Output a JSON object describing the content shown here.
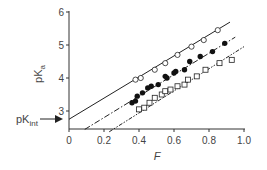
{
  "chart_data": {
    "type": "scatter",
    "title": "",
    "xlabel": "F",
    "ylabel": "pKa",
    "xlim": [
      0,
      1.0
    ],
    "ylim": [
      2.5,
      6
    ],
    "x_ticks": [
      "0",
      "0.2",
      "0.4",
      "0.6",
      "0.8",
      "1.0"
    ],
    "y_ticks": [
      "3",
      "4",
      "5",
      "6"
    ],
    "grid": false,
    "annotations": [
      {
        "text": "pKint",
        "points_to_y": 2.75,
        "style": "arrow"
      }
    ],
    "series": [
      {
        "name": "open circles",
        "marker": "open-circle",
        "line": "solid",
        "x": [
          0.38,
          0.41,
          0.49,
          0.55,
          0.62,
          0.7,
          0.77,
          0.85
        ],
        "y": [
          3.95,
          4.0,
          4.25,
          4.45,
          4.7,
          4.95,
          5.15,
          5.45
        ],
        "fit": {
          "intercept": 2.75,
          "slope": 3.2,
          "x_range": [
            0,
            0.92
          ]
        }
      },
      {
        "name": "filled circles",
        "marker": "filled-circle",
        "line": "dash-dot",
        "x": [
          0.36,
          0.38,
          0.39,
          0.42,
          0.45,
          0.47,
          0.51,
          0.55,
          0.56,
          0.6,
          0.61,
          0.66,
          0.69,
          0.75,
          0.82,
          0.89
        ],
        "y": [
          3.25,
          3.3,
          3.45,
          3.55,
          3.7,
          3.75,
          3.8,
          4.05,
          4.0,
          4.15,
          4.2,
          4.25,
          4.5,
          4.65,
          4.8,
          5.05
        ],
        "fit": {
          "intercept": 2.15,
          "slope": 3.25,
          "x_range": [
            0.09,
            0.95
          ]
        }
      },
      {
        "name": "open squares",
        "marker": "open-square",
        "line": "dash-dot-dot",
        "x": [
          0.4,
          0.43,
          0.46,
          0.49,
          0.53,
          0.55,
          0.58,
          0.62,
          0.66,
          0.68,
          0.73,
          0.78,
          0.86,
          0.93
        ],
        "y": [
          3.05,
          3.1,
          3.25,
          3.4,
          3.5,
          3.6,
          3.65,
          3.75,
          3.8,
          3.95,
          4.05,
          4.25,
          4.45,
          4.55
        ],
        "fit": {
          "intercept": 1.6,
          "slope": 3.35,
          "x_range": [
            0.23,
            1.0
          ]
        }
      }
    ]
  },
  "labels": {
    "ylabel_main": "pK",
    "ylabel_sub": "a",
    "xlabel": "F",
    "pkint_main": "pK",
    "pkint_sub": "int"
  }
}
